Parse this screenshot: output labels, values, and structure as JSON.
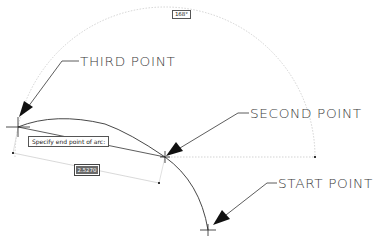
{
  "diagram": {
    "callouts": {
      "third_point": "THIRD POINT",
      "second_point": "SECOND POINT",
      "start_point": "START POINT"
    },
    "prompt_tooltip": "Specify end point of arc:",
    "angle_label": "168°",
    "dynamic_input_value": "2.5270",
    "colors": {
      "background": "#ffffff",
      "geometry": "#3a3a3a",
      "construction": "#bdbdbd",
      "arrowhead": "#111111",
      "input_highlight": "#6a6a6a"
    },
    "points": {
      "third_point": [
        18,
        127
      ],
      "second_point": [
        165,
        157
      ],
      "start_point": [
        208,
        230
      ]
    }
  }
}
